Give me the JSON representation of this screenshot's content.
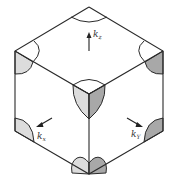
{
  "diagram": {
    "colors": {
      "edge": "#2a2a2a",
      "light_fill": "#dcdcdc",
      "dark_fill": "#a8a8a8",
      "background": "#ffffff"
    },
    "labels": {
      "kz": {
        "base": "k",
        "sub": "z"
      },
      "kx": {
        "base": "k",
        "sub": "x"
      },
      "ky": {
        "base": "k",
        "sub": "Y"
      }
    }
  }
}
